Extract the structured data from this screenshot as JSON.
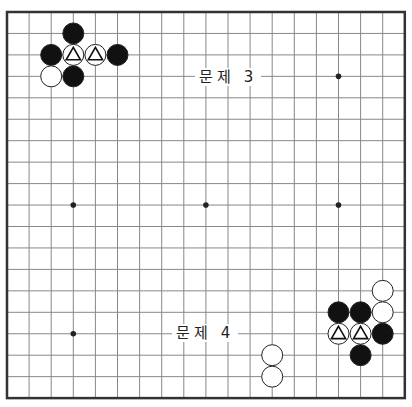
{
  "board": {
    "size": 19,
    "origin": {
      "x": 7,
      "y": 12
    },
    "spacing": {
      "x": 22.1,
      "y": 21.45
    },
    "line_color": "#888888",
    "border_color": "#333333",
    "hoshi": [
      [
        3,
        3
      ],
      [
        9,
        3
      ],
      [
        15,
        3
      ],
      [
        3,
        9
      ],
      [
        9,
        9
      ],
      [
        15,
        9
      ],
      [
        3,
        15
      ],
      [
        9,
        15
      ],
      [
        15,
        15
      ]
    ],
    "stones": [
      {
        "col": 3,
        "row": 1,
        "color": "black"
      },
      {
        "col": 2,
        "row": 2,
        "color": "black"
      },
      {
        "col": 3,
        "row": 2,
        "color": "white",
        "mark": "triangle"
      },
      {
        "col": 4,
        "row": 2,
        "color": "white",
        "mark": "triangle"
      },
      {
        "col": 5,
        "row": 2,
        "color": "black"
      },
      {
        "col": 2,
        "row": 3,
        "color": "white"
      },
      {
        "col": 3,
        "row": 3,
        "color": "black"
      },
      {
        "col": 17,
        "row": 13,
        "color": "white"
      },
      {
        "col": 15,
        "row": 14,
        "color": "black"
      },
      {
        "col": 16,
        "row": 14,
        "color": "black"
      },
      {
        "col": 17,
        "row": 14,
        "color": "white"
      },
      {
        "col": 15,
        "row": 15,
        "color": "white",
        "mark": "triangle"
      },
      {
        "col": 16,
        "row": 15,
        "color": "white",
        "mark": "triangle"
      },
      {
        "col": 17,
        "row": 15,
        "color": "black"
      },
      {
        "col": 16,
        "row": 16,
        "color": "black"
      },
      {
        "col": 12,
        "row": 16,
        "color": "white"
      },
      {
        "col": 12,
        "row": 17,
        "color": "white"
      }
    ]
  },
  "labels": {
    "problem3": "문제 3",
    "problem4": "문제 4"
  }
}
